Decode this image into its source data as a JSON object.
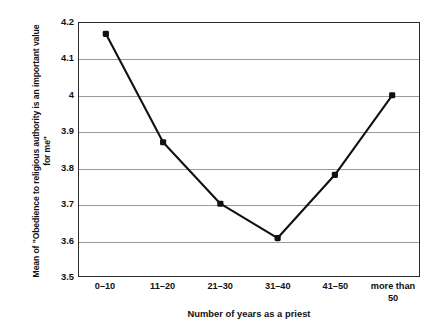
{
  "chart_data": {
    "type": "line",
    "title": "",
    "xlabel": "Number of years as a priest",
    "ylabel": "Mean of \"Obedience to religious authority is an important value for me\"",
    "ylabel_lines": [
      "Mean of \"Obedience to religious authority is an important value",
      "for me\""
    ],
    "categories": [
      "0–10",
      "11–20",
      "21–30",
      "31–40",
      "41–50",
      "more than 50"
    ],
    "category_lines": [
      [
        "0–10"
      ],
      [
        "11–20"
      ],
      [
        "21–30"
      ],
      [
        "31–40"
      ],
      [
        "41–50"
      ],
      [
        "more than",
        "50"
      ]
    ],
    "values": [
      4.17,
      3.87,
      3.7,
      3.605,
      3.78,
      4.0
    ],
    "ylim": [
      3.5,
      4.2
    ],
    "ytick_values": [
      3.5,
      3.6,
      3.7,
      3.8,
      3.9,
      4.0,
      4.1,
      4.2
    ],
    "ytick_labels": [
      "3.5",
      "3.6",
      "3.7",
      "3.8",
      "3.9",
      "4",
      "4.1",
      "4.2"
    ],
    "grid": "horizontal",
    "legend": "none",
    "series_color": "#111111",
    "marker": "filled-square",
    "gridline_color": "#9a9a9a",
    "frame_color": "#2b2b2b",
    "background_color": "#ffffff"
  }
}
